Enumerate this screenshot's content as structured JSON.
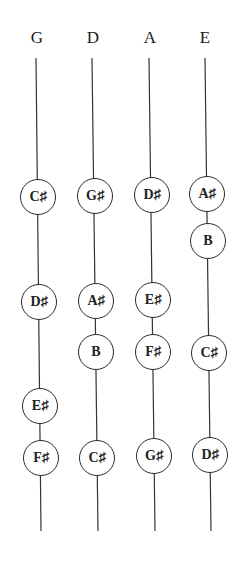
{
  "strings": [
    {
      "name": "G",
      "x_top": 36,
      "x_bottom": 41
    },
    {
      "name": "D",
      "x_top": 92,
      "x_bottom": 98
    },
    {
      "name": "A",
      "x_top": 149,
      "x_bottom": 155
    },
    {
      "name": "E",
      "x_top": 205,
      "x_bottom": 211
    }
  ],
  "line_top": 58,
  "line_bottom": 531,
  "notes": {
    "G": [
      {
        "label": "C♯",
        "y": 197
      },
      {
        "label": "D♯",
        "y": 302
      },
      {
        "label": "E♯",
        "y": 406
      },
      {
        "label": "F♯",
        "y": 458
      }
    ],
    "D": [
      {
        "label": "G♯",
        "y": 196
      },
      {
        "label": "A♯",
        "y": 301
      },
      {
        "label": "B",
        "y": 352
      },
      {
        "label": "C♯",
        "y": 458
      }
    ],
    "A": [
      {
        "label": "D♯",
        "y": 195
      },
      {
        "label": "E♯",
        "y": 300
      },
      {
        "label": "F♯",
        "y": 352
      },
      {
        "label": "G♯",
        "y": 456
      }
    ],
    "E": [
      {
        "label": "A♯",
        "y": 194
      },
      {
        "label": "B",
        "y": 241
      },
      {
        "label": "C♯",
        "y": 353
      },
      {
        "label": "D♯",
        "y": 455
      }
    ]
  }
}
